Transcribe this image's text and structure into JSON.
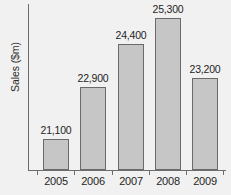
{
  "chart_data": {
    "type": "bar",
    "title": "",
    "xlabel": "",
    "ylabel": "Sales ($m)",
    "categories": [
      "2005",
      "2006",
      "2007",
      "2008",
      "2009"
    ],
    "values": [
      21100,
      22900,
      24400,
      25300,
      23200
    ],
    "value_labels": [
      "21,100",
      "22,900",
      "24,400",
      "25,300",
      "23,200"
    ],
    "ylim": [
      20000,
      25800
    ],
    "grid": false,
    "legend": null,
    "axis_color": "#6d6d6d",
    "bar_fill_color": "#c6c6c6",
    "bar_border_color": "#6a6a6a",
    "background_color": "#f1f1f1"
  }
}
